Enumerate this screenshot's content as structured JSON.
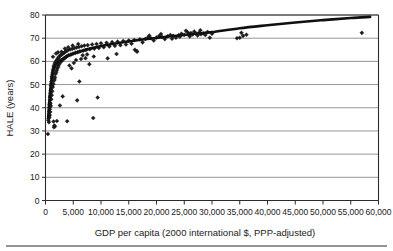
{
  "chart_data": {
    "type": "scatter",
    "title": "",
    "xlabel": "GDP per capita (2000 international $, PPP-adjusted)",
    "ylabel": "HALE (years)",
    "xlim": [
      0,
      60000
    ],
    "ylim": [
      0,
      80
    ],
    "grid": "horizontal",
    "legend": "none",
    "xticks": [
      0,
      5000,
      10000,
      15000,
      20000,
      25000,
      30000,
      35000,
      40000,
      45000,
      50000,
      55000,
      60000
    ],
    "xtick_labels": [
      "0",
      "5,000",
      "10,000",
      "15,000",
      "20,000",
      "25,000",
      "30,000",
      "35,000",
      "40,000",
      "45,000",
      "50,000",
      "55,000",
      "60,000"
    ],
    "yticks": [
      0,
      10,
      20,
      30,
      40,
      50,
      60,
      70,
      80
    ],
    "ytick_labels": [
      "0",
      "10",
      "20",
      "30",
      "40",
      "50",
      "60",
      "70",
      "80"
    ],
    "marker": "diamond",
    "marker_color": "#1c1c1c",
    "trend_color": "#101010",
    "series": [
      {
        "name": "Countries",
        "points": [
          [
            430,
            28.7
          ],
          [
            520,
            34.6
          ],
          [
            560,
            35.4
          ],
          [
            600,
            36.1
          ],
          [
            620,
            33.8
          ],
          [
            650,
            37.2
          ],
          [
            670,
            38.5
          ],
          [
            690,
            35.9
          ],
          [
            700,
            40.1
          ],
          [
            720,
            41.3
          ],
          [
            740,
            36.8
          ],
          [
            760,
            42.0
          ],
          [
            780,
            39.4
          ],
          [
            800,
            43.2
          ],
          [
            820,
            44.6
          ],
          [
            840,
            38.2
          ],
          [
            860,
            45.1
          ],
          [
            880,
            41.9
          ],
          [
            900,
            46.3
          ],
          [
            930,
            47.5
          ],
          [
            950,
            40.8
          ],
          [
            980,
            48.2
          ],
          [
            1000,
            49.6
          ],
          [
            1030,
            43.7
          ],
          [
            1060,
            50.3
          ],
          [
            1090,
            51.2
          ],
          [
            1120,
            45.4
          ],
          [
            1150,
            52.8
          ],
          [
            1180,
            53.5
          ],
          [
            1210,
            47.1
          ],
          [
            1240,
            54.2
          ],
          [
            1270,
            55.0
          ],
          [
            1300,
            48.9
          ],
          [
            1340,
            55.8
          ],
          [
            1380,
            56.4
          ],
          [
            1420,
            50.2
          ],
          [
            1460,
            57.1
          ],
          [
            1500,
            57.8
          ],
          [
            1540,
            51.7
          ],
          [
            1580,
            58.3
          ],
          [
            1620,
            52.4
          ],
          [
            1660,
            58.9
          ],
          [
            1700,
            53.1
          ],
          [
            1750,
            59.4
          ],
          [
            1800,
            54.6
          ],
          [
            1850,
            59.8
          ],
          [
            1900,
            55.2
          ],
          [
            1950,
            60.1
          ],
          [
            2000,
            56.0
          ],
          [
            2050,
            60.5
          ],
          [
            2100,
            56.8
          ],
          [
            2150,
            60.9
          ],
          [
            2200,
            57.4
          ],
          [
            2250,
            61.2
          ],
          [
            2300,
            58.0
          ],
          [
            2350,
            61.6
          ],
          [
            2400,
            58.6
          ],
          [
            2450,
            62.0
          ],
          [
            2500,
            59.1
          ],
          [
            2600,
            62.4
          ],
          [
            2700,
            59.7
          ],
          [
            2800,
            62.8
          ],
          [
            2900,
            60.2
          ],
          [
            3000,
            63.1
          ],
          [
            3100,
            60.7
          ],
          [
            3200,
            63.5
          ],
          [
            3300,
            61.1
          ],
          [
            3400,
            63.8
          ],
          [
            3500,
            61.5
          ],
          [
            3600,
            64.2
          ],
          [
            3700,
            61.9
          ],
          [
            3800,
            64.5
          ],
          [
            3900,
            62.3
          ],
          [
            4000,
            64.8
          ],
          [
            4200,
            62.7
          ],
          [
            4400,
            65.1
          ],
          [
            4600,
            63.0
          ],
          [
            4800,
            65.4
          ],
          [
            5000,
            63.4
          ],
          [
            5200,
            65.7
          ],
          [
            5400,
            63.7
          ],
          [
            5600,
            66.0
          ],
          [
            5800,
            64.0
          ],
          [
            6000,
            66.2
          ],
          [
            6200,
            64.3
          ],
          [
            6500,
            66.5
          ],
          [
            6800,
            64.6
          ],
          [
            7000,
            66.8
          ],
          [
            7300,
            64.9
          ],
          [
            7600,
            67.0
          ],
          [
            8000,
            65.2
          ],
          [
            8400,
            67.3
          ],
          [
            8800,
            65.5
          ],
          [
            9200,
            67.5
          ],
          [
            9600,
            65.8
          ],
          [
            10000,
            67.8
          ],
          [
            10500,
            66.1
          ],
          [
            11000,
            68.0
          ],
          [
            11500,
            66.4
          ],
          [
            12000,
            68.3
          ],
          [
            12500,
            66.7
          ],
          [
            13000,
            68.5
          ],
          [
            13500,
            67.0
          ],
          [
            14000,
            68.8
          ],
          [
            14500,
            67.3
          ],
          [
            15000,
            69.0
          ],
          [
            15500,
            67.6
          ],
          [
            16000,
            69.2
          ],
          [
            16500,
            64.2
          ],
          [
            17000,
            69.5
          ],
          [
            17500,
            68.2
          ],
          [
            18000,
            69.7
          ],
          [
            18500,
            70.4
          ],
          [
            19000,
            70.0
          ],
          [
            19500,
            69.0
          ],
          [
            20000,
            70.3
          ],
          [
            20500,
            71.0
          ],
          [
            21000,
            70.5
          ],
          [
            21500,
            69.6
          ],
          [
            22000,
            70.8
          ],
          [
            22500,
            71.4
          ],
          [
            23000,
            71.0
          ],
          [
            23500,
            70.2
          ],
          [
            24000,
            71.3
          ],
          [
            24500,
            71.9
          ],
          [
            25000,
            71.5
          ],
          [
            25300,
            73.2
          ],
          [
            25600,
            72.6
          ],
          [
            25900,
            71.8
          ],
          [
            26200,
            72.2
          ],
          [
            26500,
            71.6
          ],
          [
            26800,
            72.9
          ],
          [
            27100,
            72.0
          ],
          [
            27400,
            71.2
          ],
          [
            27700,
            72.4
          ],
          [
            28000,
            71.7
          ],
          [
            28400,
            72.1
          ],
          [
            28800,
            71.4
          ],
          [
            29200,
            72.7
          ],
          [
            29600,
            70.2
          ],
          [
            30000,
            71.9
          ],
          [
            34500,
            70.0
          ],
          [
            35000,
            70.2
          ],
          [
            35300,
            72.3
          ],
          [
            35600,
            71.0
          ],
          [
            36200,
            71.5
          ],
          [
            57000,
            72.3
          ],
          [
            1450,
            34.1
          ],
          [
            1520,
            31.6
          ],
          [
            1600,
            32.3
          ],
          [
            1680,
            31.9
          ],
          [
            2050,
            34.3
          ],
          [
            3900,
            34.2
          ],
          [
            5700,
            43.2
          ],
          [
            6100,
            51.3
          ],
          [
            8600,
            35.6
          ],
          [
            9400,
            44.4
          ],
          [
            2600,
            41.0
          ],
          [
            3100,
            44.9
          ],
          [
            4300,
            58.2
          ],
          [
            4700,
            57.0
          ],
          [
            5100,
            59.3
          ],
          [
            5500,
            60.6
          ],
          [
            6400,
            61.0
          ],
          [
            7200,
            61.4
          ],
          [
            7900,
            58.8
          ],
          [
            8700,
            62.1
          ],
          [
            1350,
            62.0
          ],
          [
            1900,
            63.4
          ],
          [
            2250,
            63.9
          ],
          [
            2900,
            64.1
          ],
          [
            3500,
            65.5
          ],
          [
            4100,
            66.1
          ],
          [
            4900,
            66.8
          ],
          [
            5900,
            67.5
          ],
          [
            6700,
            62.6
          ],
          [
            7500,
            63.0
          ],
          [
            11200,
            61.3
          ],
          [
            12800,
            63.2
          ],
          [
            16100,
            65.0
          ],
          [
            16400,
            64.5
          ],
          [
            18700,
            71.1
          ],
          [
            20800,
            71.8
          ],
          [
            22800,
            69.8
          ],
          [
            24200,
            70.6
          ],
          [
            26000,
            70.8
          ],
          [
            27900,
            73.4
          ]
        ]
      }
    ],
    "trend": {
      "name": "Fitted curve",
      "description": "Logarithmic fit rising steeply at low GDP then flattening",
      "points": [
        [
          500,
          36.0
        ],
        [
          700,
          43.0
        ],
        [
          900,
          48.5
        ],
        [
          1100,
          52.5
        ],
        [
          1400,
          56.0
        ],
        [
          1800,
          58.4
        ],
        [
          2300,
          59.8
        ],
        [
          3000,
          61.0
        ],
        [
          4000,
          62.3
        ],
        [
          5000,
          63.3
        ],
        [
          6500,
          64.5
        ],
        [
          8000,
          65.5
        ],
        [
          10000,
          66.6
        ],
        [
          12500,
          67.7
        ],
        [
          15000,
          68.6
        ],
        [
          17500,
          69.4
        ],
        [
          20000,
          70.1
        ],
        [
          22500,
          70.8
        ],
        [
          25000,
          71.4
        ],
        [
          27500,
          72.0
        ],
        [
          30000,
          72.6
        ],
        [
          35000,
          74.3
        ],
        [
          40000,
          75.6
        ],
        [
          45000,
          76.8
        ],
        [
          50000,
          77.8
        ],
        [
          55000,
          78.7
        ],
        [
          58500,
          79.2
        ]
      ]
    }
  }
}
